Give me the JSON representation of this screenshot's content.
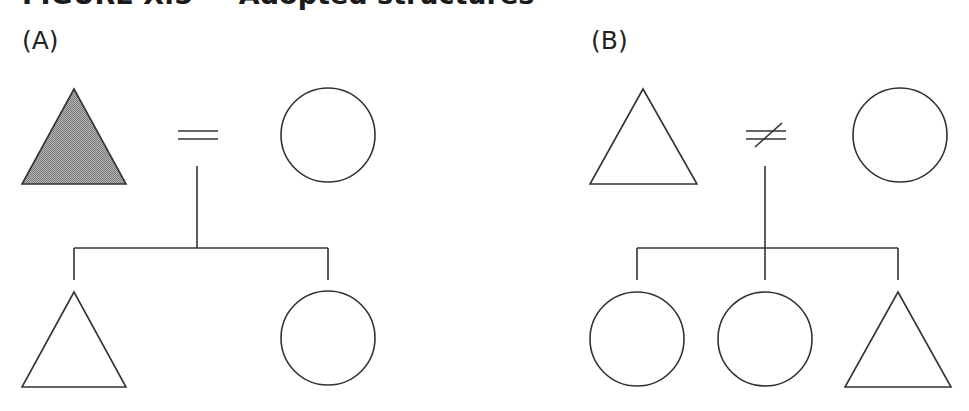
{
  "figure": {
    "title": "FIGURE X.5 — Adopted structures",
    "title_clipped": true
  },
  "panels": [
    {
      "label": "(A)",
      "parents": {
        "left": {
          "shape": "triangle",
          "sex": "male",
          "filled": true
        },
        "relation": {
          "symbol": "=",
          "meaning": "marriage"
        },
        "right": {
          "shape": "circle",
          "sex": "female",
          "filled": false
        }
      },
      "children": [
        {
          "shape": "triangle",
          "sex": "male",
          "filled": false
        },
        {
          "shape": "circle",
          "sex": "female",
          "filled": false
        }
      ]
    },
    {
      "label": "(B)",
      "parents": {
        "left": {
          "shape": "triangle",
          "sex": "male",
          "filled": false
        },
        "relation": {
          "symbol": "≠",
          "meaning": "divorce"
        },
        "right": {
          "shape": "circle",
          "sex": "female",
          "filled": false
        }
      },
      "children": [
        {
          "shape": "circle",
          "sex": "female",
          "filled": false
        },
        {
          "shape": "circle",
          "sex": "female",
          "filled": false
        },
        {
          "shape": "triangle",
          "sex": "male",
          "filled": false
        }
      ]
    }
  ],
  "colors": {
    "stroke": "#333333",
    "fill_shaded": "#9a9a9a",
    "background": "#ffffff"
  }
}
